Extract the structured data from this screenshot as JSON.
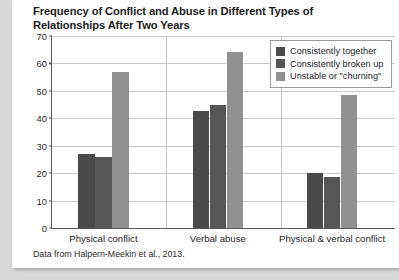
{
  "chart_data": {
    "type": "bar",
    "title": "Frequency of Conflict and Abuse in Different Types of Relationships After Two Years",
    "categories": [
      "Physical conflict",
      "Verbal abuse",
      "Physical & verbal conflict"
    ],
    "series": [
      {
        "name": "Consistently together",
        "color": "#4a4a4a",
        "values": [
          27,
          42.5,
          20
        ]
      },
      {
        "name": "Consistently broken up",
        "color": "#565656",
        "values": [
          26,
          45,
          18.5
        ]
      },
      {
        "name": "Unstable or \"churning\"",
        "color": "#919191",
        "values": [
          57,
          64,
          48.5
        ]
      }
    ],
    "xlabel": "",
    "ylabel": "",
    "ylim": [
      0,
      70
    ],
    "yticks": [
      0,
      10,
      20,
      30,
      40,
      50,
      60,
      70
    ],
    "grid": true,
    "legend_position": "top-right",
    "source_note": "Data from Halpern-Meekin et al., 2013."
  }
}
